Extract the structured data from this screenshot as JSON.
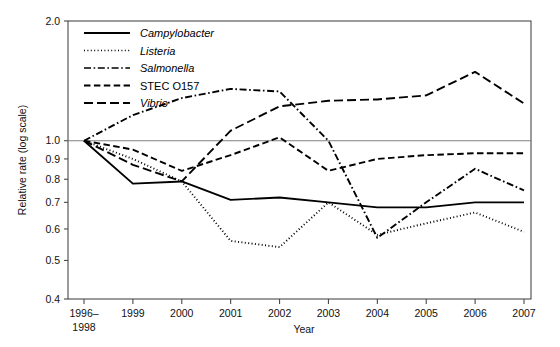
{
  "chart_data": {
    "type": "line",
    "title": "",
    "xlabel": "Year",
    "ylabel": "Relative rate (log scale)",
    "scale": "log",
    "ylim": [
      0.4,
      2.0
    ],
    "ytick_labels": [
      "2.0",
      "1.0",
      "0.9",
      "0.8",
      "0.7",
      "0.6",
      "0.5",
      "0.4"
    ],
    "ytick_values": [
      2.0,
      1.0,
      0.9,
      0.8,
      0.7,
      0.6,
      0.5,
      0.4
    ],
    "reference_line": 1.0,
    "grid": false,
    "legend_position": "top-left",
    "categories": [
      "1996–\n1998",
      "1999",
      "2000",
      "2001",
      "2002",
      "2003",
      "2004",
      "2005",
      "2006",
      "2007"
    ],
    "x_tick_labels": [
      "1996–",
      "1999",
      "2000",
      "2001",
      "2002",
      "2003",
      "2004",
      "2005",
      "2006",
      "2007"
    ],
    "x_tick_sublabel_first": "1998",
    "series": [
      {
        "name": "Campylobacter",
        "italic": true,
        "dash": "solid",
        "values": [
          1.0,
          0.78,
          0.79,
          0.71,
          0.72,
          0.7,
          0.68,
          0.68,
          0.7,
          0.7
        ]
      },
      {
        "name": "Listeria",
        "italic": true,
        "dash": "dotted",
        "values": [
          1.0,
          0.9,
          0.79,
          0.56,
          0.54,
          0.7,
          0.58,
          0.62,
          0.66,
          0.59
        ]
      },
      {
        "name": "Salmonella",
        "italic": true,
        "dash": "dashdot",
        "values": [
          1.0,
          1.16,
          1.28,
          1.35,
          1.33,
          1.0,
          0.57,
          0.7,
          0.85,
          0.75
        ]
      },
      {
        "name": "STEC O157",
        "italic": false,
        "dash": "dashed",
        "values": [
          1.0,
          0.95,
          0.84,
          0.92,
          1.02,
          0.84,
          0.9,
          0.92,
          0.93,
          0.93
        ]
      },
      {
        "name": "Vibrio",
        "italic": true,
        "dash": "longdash",
        "values": [
          1.0,
          0.87,
          0.79,
          1.06,
          1.22,
          1.26,
          1.27,
          1.3,
          1.49,
          1.24
        ]
      }
    ]
  },
  "legend": {
    "items": [
      {
        "label": "Campylobacter"
      },
      {
        "label": "Listeria"
      },
      {
        "label": "Salmonella"
      },
      {
        "label": "STEC O157"
      },
      {
        "label": "Vibrio"
      }
    ]
  },
  "axes": {
    "y_title": "Relative rate (log scale)",
    "x_title": "Year"
  }
}
